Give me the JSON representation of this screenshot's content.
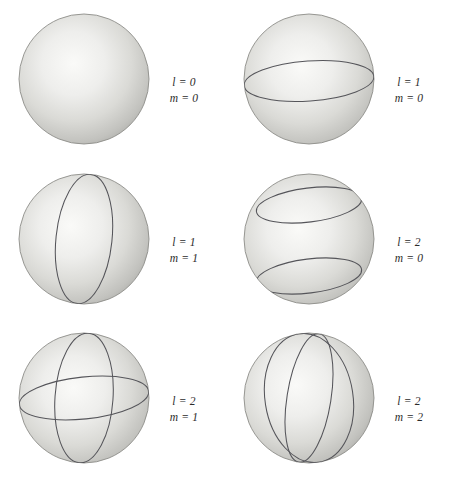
{
  "figure": {
    "background_color": "#ffffff",
    "width": 450,
    "height": 479,
    "columns": 2,
    "rows": 3
  },
  "style": {
    "sphere_light": "#f2f2f0",
    "sphere_mid": "#cfcfcb",
    "sphere_edge": "#9d9d99",
    "sphere_rim": "#8a8a86",
    "nodal_line_color": "#55555a",
    "label_color": "#2b2b2b",
    "equals_sign": "=",
    "l_symbol": "l",
    "m_symbol": "m"
  },
  "panels": [
    {
      "id": "panel-l0-m0",
      "l_symbol": "l",
      "m_symbol": "m",
      "eq": "=",
      "l_value": "0",
      "m_value": "0",
      "label_l": "l = 0",
      "label_m": "m = 0",
      "nodal_meridians": 0,
      "nodal_latitudes": 0,
      "description": "Uniform sphere, no nodal lines"
    },
    {
      "id": "panel-l1-m0",
      "l_symbol": "l",
      "m_symbol": "m",
      "eq": "=",
      "l_value": "1",
      "m_value": "0",
      "label_l": "l = 1",
      "label_m": "m = 0",
      "nodal_meridians": 0,
      "nodal_latitudes": 1,
      "latitudes_deg": [
        0
      ],
      "description": "One horizontal nodal circle at the equator"
    },
    {
      "id": "panel-l1-m1",
      "l_symbol": "l",
      "m_symbol": "m",
      "eq": "=",
      "l_value": "1",
      "m_value": "1",
      "label_l": "l = 1",
      "label_m": "m = 1",
      "nodal_meridians": 1,
      "nodal_latitudes": 0,
      "meridian_angles_deg": [
        18
      ],
      "description": "One vertical nodal meridian circle"
    },
    {
      "id": "panel-l2-m0",
      "l_symbol": "l",
      "m_symbol": "m",
      "eq": "=",
      "l_value": "2",
      "m_value": "0",
      "label_l": "l = 2",
      "label_m": "m = 0",
      "nodal_meridians": 0,
      "nodal_latitudes": 2,
      "latitudes_deg": [
        55,
        -55
      ],
      "description": "Two horizontal nodal circles at about plus and minus 55 degrees latitude"
    },
    {
      "id": "panel-l2-m1",
      "l_symbol": "l",
      "m_symbol": "m",
      "eq": "=",
      "l_value": "2",
      "m_value": "1",
      "label_l": "l = 2",
      "label_m": "m = 1",
      "nodal_meridians": 1,
      "nodal_latitudes": 1,
      "latitudes_deg": [
        0
      ],
      "meridian_angles_deg": [
        12
      ],
      "description": "One vertical meridian and one equatorial nodal circle"
    },
    {
      "id": "panel-l2-m2",
      "l_symbol": "l",
      "m_symbol": "m",
      "eq": "=",
      "l_value": "2",
      "m_value": "2",
      "label_l": "l = 2",
      "label_m": "m = 2",
      "nodal_meridians": 2,
      "nodal_latitudes": 0,
      "meridian_angles_deg": [
        -22,
        26
      ],
      "description": "Two vertical nodal meridian circles"
    }
  ]
}
